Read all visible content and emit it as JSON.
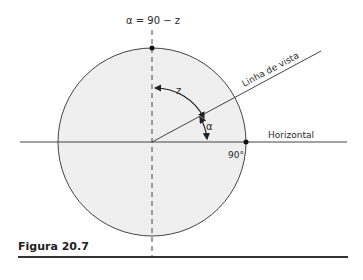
{
  "figure": {
    "formula": "α = 90 − z",
    "line_of_sight_label": "Linha de vista",
    "horizontal_label": "Horizontal",
    "angle_z_label": "z",
    "angle_alpha_label": "α",
    "right_angle_label": "90°",
    "caption": "Figura 20.7",
    "colors": {
      "circle_fill": "#efefef",
      "line": "#333333"
    }
  }
}
